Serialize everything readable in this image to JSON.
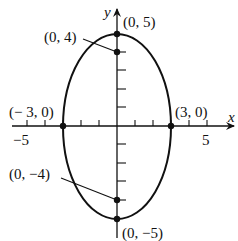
{
  "diagram": {
    "type": "ellipse-graph",
    "equation_center": [
      0,
      0
    ],
    "semi_axis_x": 3,
    "semi_axis_y": 5,
    "axes": {
      "x_label": "x",
      "y_label": "y",
      "x_tick_labels": [
        {
          "value": -5,
          "text": "−5"
        },
        {
          "value": 5,
          "text": "5"
        }
      ]
    },
    "points": [
      {
        "id": "top-vertex",
        "x": 0,
        "y": 5,
        "label": "(0, 5)"
      },
      {
        "id": "bottom-vertex",
        "x": 0,
        "y": -5,
        "label": "(0, −5)"
      },
      {
        "id": "left-covertex",
        "x": -3,
        "y": 0,
        "label": "(− 3, 0)"
      },
      {
        "id": "right-covertex",
        "x": 3,
        "y": 0,
        "label": "(3, 0)"
      },
      {
        "id": "focus-top",
        "x": 0,
        "y": 4,
        "label": "(0, 4)"
      },
      {
        "id": "focus-bottom",
        "x": 0,
        "y": -4,
        "label": "(0, −4)"
      }
    ]
  }
}
